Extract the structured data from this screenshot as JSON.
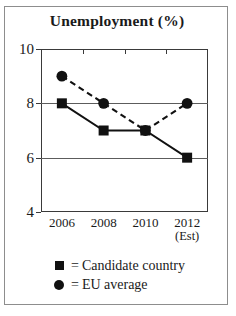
{
  "chart_data": {
    "type": "line",
    "title": "Unemployment (%)",
    "xlabel": "",
    "ylabel": "",
    "categories": [
      "2006",
      "2008",
      "2010",
      "2012"
    ],
    "category_sublabels": [
      "",
      "",
      "",
      "(Est)"
    ],
    "ylim": [
      4,
      10
    ],
    "yticks": [
      4,
      6,
      8,
      10
    ],
    "ytick_labels": [
      "4",
      "6",
      "8",
      "10"
    ],
    "grid": "horizontal",
    "legend_position": "below",
    "series": [
      {
        "name": "Candidate country",
        "values": [
          8,
          7,
          7,
          6
        ],
        "marker": "square",
        "line_style": "solid",
        "color": "#111111"
      },
      {
        "name": "EU average",
        "values": [
          9,
          8,
          7,
          8
        ],
        "marker": "circle",
        "line_style": "dashed",
        "color": "#111111"
      }
    ]
  },
  "legend": {
    "equals": "=",
    "entries": [
      {
        "marker": "square-marker-icon",
        "label": "Candidate country"
      },
      {
        "marker": "circle-marker-icon",
        "label": "EU average"
      }
    ]
  },
  "colors": {
    "ink": "#111111",
    "axis": "#3a3a3a",
    "grid": "#5c5c5c",
    "frame": "#8d8d8d",
    "background": "#ffffff"
  }
}
